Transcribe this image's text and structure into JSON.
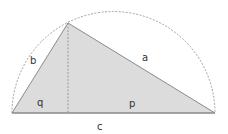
{
  "diagram": {
    "type": "right-triangle-in-semicircle",
    "labels": {
      "hypotenuse": "c",
      "leg_left": "b",
      "leg_right": "a",
      "segment_left": "q",
      "segment_right": "p"
    },
    "colors": {
      "fill": "#dcdcdc",
      "stroke": "#8a8a8a",
      "arc": "#8a8a8a",
      "altitude": "#8a8a8a",
      "text": "#333333"
    }
  }
}
